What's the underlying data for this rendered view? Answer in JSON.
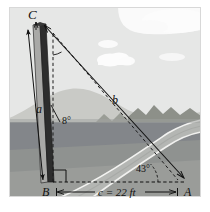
{
  "figure": {
    "caption": "",
    "vertices": {
      "C": "C",
      "B": "B",
      "A": "A"
    },
    "sides": {
      "a": "a",
      "b": "b",
      "c_label": "c = 22 ft"
    },
    "angles": {
      "lean": "8°",
      "elevation": "43°"
    },
    "colors": {
      "sky": "#e6e7e6",
      "cloud": "#fbfbfb",
      "far_hill": "#c9cac6",
      "mid_hill": "#b0b2ad",
      "dark_hill": "#8d9089",
      "ground_far": "#84878a",
      "ground_near": "#9a9c9a",
      "road": "#b7b9b6",
      "road_line": "#f4f4f2",
      "tower_dark": "#2e2e2e",
      "tower_light": "#9b9b9b",
      "ink": "#111111"
    },
    "scene": {
      "objects": [
        "sky",
        "clouds",
        "distant-mountains",
        "ground",
        "curved-road",
        "leaning-tower"
      ]
    }
  }
}
